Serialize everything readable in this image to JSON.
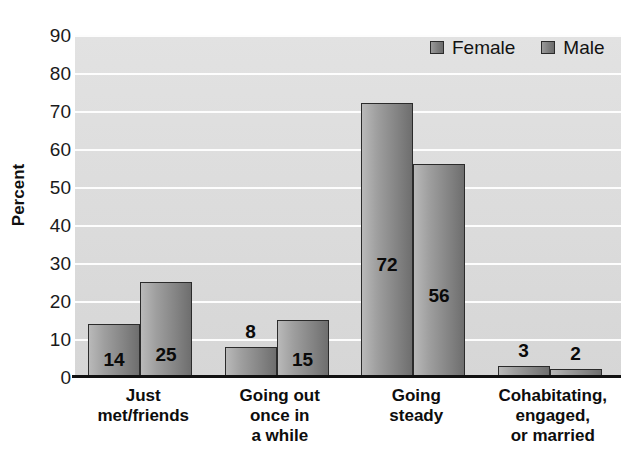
{
  "chart_data": {
    "type": "bar",
    "title": "",
    "subtitle": "",
    "xlabel": "",
    "ylabel": "Percent",
    "ylim": [
      0,
      90
    ],
    "ytick_step": 10,
    "yticks": [
      "0",
      "10",
      "20",
      "30",
      "40",
      "50",
      "60",
      "70",
      "80",
      "90"
    ],
    "grid": true,
    "legend_position": "top-right",
    "categories": [
      "Just met/friends",
      "Going out once in a while",
      "Going steady",
      "Cohabitating, engaged, or married"
    ],
    "category_label_lines": [
      [
        "Just",
        "met/friends"
      ],
      [
        "Going out",
        "once in",
        "a while"
      ],
      [
        "Going",
        "steady"
      ],
      [
        "Cohabitating,",
        "engaged,",
        "or married"
      ]
    ],
    "series": [
      {
        "name": "Female",
        "values": [
          14,
          8,
          72,
          3
        ],
        "color": "#7d7d7d"
      },
      {
        "name": "Male",
        "values": [
          25,
          15,
          56,
          2
        ],
        "color": "#7d7d7d"
      }
    ],
    "data_labels": [
      {
        "category": "Just met/friends",
        "series": "Female",
        "value": 14,
        "placement": "inside"
      },
      {
        "category": "Just met/friends",
        "series": "Male",
        "value": 25,
        "placement": "inside"
      },
      {
        "category": "Going out once in a while",
        "series": "Female",
        "value": 8,
        "placement": "outside"
      },
      {
        "category": "Going out once in a while",
        "series": "Male",
        "value": 15,
        "placement": "inside"
      },
      {
        "category": "Going steady",
        "series": "Female",
        "value": 72,
        "placement": "inside"
      },
      {
        "category": "Going steady",
        "series": "Male",
        "value": 56,
        "placement": "inside"
      },
      {
        "category": "Cohabitating, engaged, or married",
        "series": "Female",
        "value": 3,
        "placement": "outside"
      },
      {
        "category": "Cohabitating, engaged, or married",
        "series": "Male",
        "value": 2,
        "placement": "outside"
      }
    ],
    "colors": {
      "plot_background": "#dcdcdc",
      "gridline": "#fdfdfd",
      "axis": "#111111",
      "bar_fill_light": "#b9b9b9",
      "bar_fill_dark": "#6e6e6e",
      "bar_border": "#2b2b2b",
      "text": "#101010",
      "page_background": "#ffffff"
    }
  },
  "legend": {
    "items": [
      {
        "label": "Female"
      },
      {
        "label": "Male"
      }
    ]
  }
}
